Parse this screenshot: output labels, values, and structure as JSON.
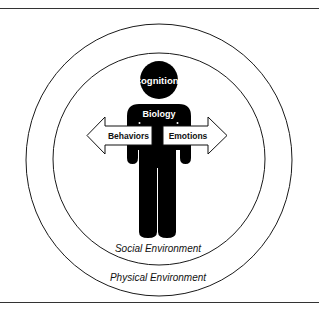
{
  "diagram": {
    "type": "biopsychosocial-model",
    "colors": {
      "figure": "#000000",
      "background": "#ffffff",
      "lines": "#1a1a1a",
      "label_on_figure": "#ffffff",
      "label_on_arrow": "#111111"
    },
    "figure": {
      "head_label": "Cognitions",
      "body_label": "Biology"
    },
    "arrows": {
      "left_label": "Behaviors",
      "right_label": "Emotions"
    },
    "rings": {
      "inner_label": "Social Environment",
      "outer_label": "Physical Environment"
    }
  }
}
